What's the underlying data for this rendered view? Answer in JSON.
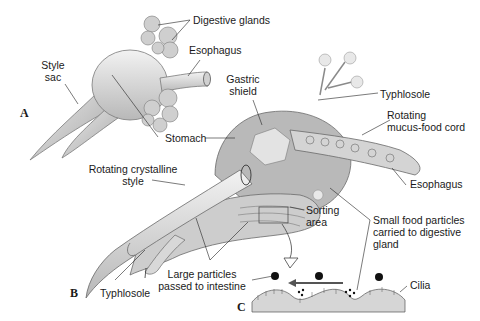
{
  "figure": {
    "panels": {
      "a": "A",
      "b": "B",
      "c": "C"
    },
    "labels": {
      "digestive_glands": "Digestive glands",
      "esophagus_a": "Esophagus",
      "style_sac_1": "Style",
      "style_sac_2": "sac",
      "stomach": "Stomach",
      "gastric_shield_1": "Gastric",
      "gastric_shield_2": "shield",
      "typhlosole_top": "Typhlosole",
      "rotating_cord_1": "Rotating",
      "rotating_cord_2": "mucus-food cord",
      "rotating_style_1": "Rotating crystalline",
      "rotating_style_2": "style",
      "esophagus_b": "Esophagus",
      "sorting_area_1": "Sorting",
      "sorting_area_2": "area",
      "small_particles_1": "Small food particles",
      "small_particles_2": "carried to digestive",
      "small_particles_3": "gland",
      "large_particles_1": "Large particles",
      "large_particles_2": "passed to intestine",
      "typhlosole_bottom": "Typhlosole",
      "cilia": "Cilia"
    },
    "colors": {
      "organ_fill": "#d9d9d9",
      "organ_stroke": "#7a7a7a",
      "shadow": "#a8a8a8",
      "ground": "#d6d6d6",
      "ink": "#1a1a1a"
    }
  }
}
